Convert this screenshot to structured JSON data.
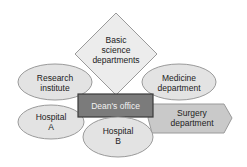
{
  "diagram": {
    "center": {
      "label": "Dean's office",
      "fill": "#7b7b7b",
      "border": "#3a3a3a",
      "text_color": "#f0f0f0"
    },
    "nodes": [
      {
        "id": "basic-science",
        "shape": "diamond",
        "line1": "Basic",
        "line2": "science",
        "line3": "departments",
        "fill": "#ececec"
      },
      {
        "id": "research-institute",
        "shape": "ellipse",
        "line1": "Research",
        "line2": "institute",
        "fill": "#e3e3e3"
      },
      {
        "id": "medicine-department",
        "shape": "ellipse",
        "line1": "Medicine",
        "line2": "department",
        "fill": "#e3e3e3"
      },
      {
        "id": "hospital-a",
        "shape": "ellipse",
        "line1": "Hospital",
        "line2": "A",
        "fill": "#e3e3e3"
      },
      {
        "id": "hospital-b",
        "shape": "ellipse",
        "line1": "Hospital",
        "line2": "B",
        "fill": "#e3e3e3"
      },
      {
        "id": "surgery-department",
        "shape": "hexagon",
        "line1": "Surgery",
        "line2": "department",
        "fill": "#c9c9c9"
      }
    ],
    "stroke_color": "#9a9a9a"
  }
}
